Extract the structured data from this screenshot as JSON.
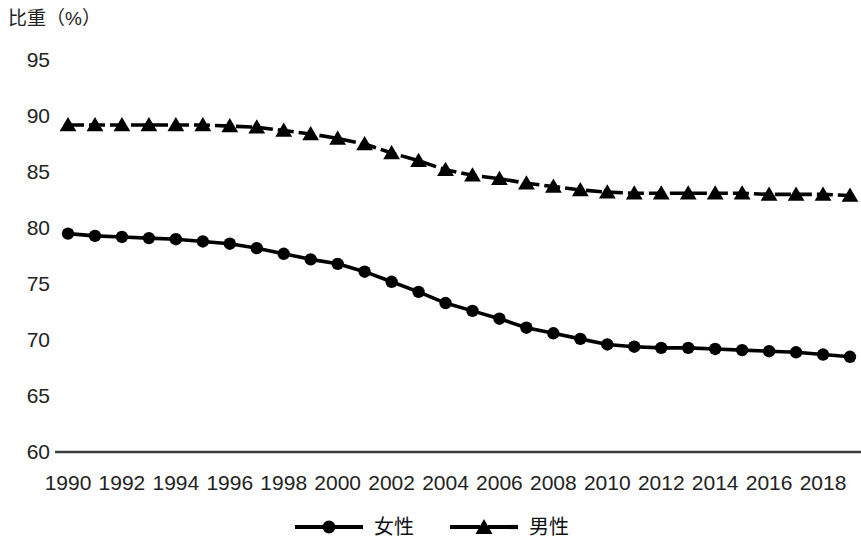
{
  "chart_data": {
    "type": "line",
    "title": "比重（%）",
    "xlabel": "",
    "ylabel": "比重（%）",
    "ylim": [
      60,
      95
    ],
    "ytick_step": 5,
    "yticks": [
      95,
      90,
      85,
      80,
      75,
      70,
      65,
      60
    ],
    "xlim": [
      1990,
      2019
    ],
    "xticks": [
      1990,
      1992,
      1994,
      1996,
      1998,
      2000,
      2002,
      2004,
      2006,
      2008,
      2010,
      2012,
      2014,
      2016,
      2018
    ],
    "x": [
      1990,
      1991,
      1992,
      1993,
      1994,
      1995,
      1996,
      1997,
      1998,
      1999,
      2000,
      2001,
      2002,
      2003,
      2004,
      2005,
      2006,
      2007,
      2008,
      2009,
      2010,
      2011,
      2012,
      2013,
      2014,
      2015,
      2016,
      2017,
      2018,
      2019
    ],
    "grid": false,
    "legend_position": "bottom",
    "series": [
      {
        "name": "女性",
        "marker": "circle",
        "linestyle": "solid",
        "color": "#000000",
        "values": [
          79.5,
          79.3,
          79.2,
          79.1,
          79.0,
          78.8,
          78.6,
          78.2,
          77.7,
          77.2,
          76.8,
          76.1,
          75.2,
          74.3,
          73.3,
          72.6,
          71.9,
          71.1,
          70.6,
          70.1,
          69.6,
          69.4,
          69.3,
          69.3,
          69.2,
          69.1,
          69.0,
          68.9,
          68.7,
          68.5
        ]
      },
      {
        "name": "男性",
        "marker": "triangle",
        "linestyle": "dashed",
        "color": "#000000",
        "values": [
          89.2,
          89.2,
          89.2,
          89.2,
          89.2,
          89.2,
          89.1,
          89.0,
          88.7,
          88.4,
          88.0,
          87.5,
          86.7,
          86.0,
          85.2,
          84.7,
          84.4,
          84.0,
          83.7,
          83.4,
          83.2,
          83.1,
          83.1,
          83.1,
          83.1,
          83.1,
          83.0,
          83.0,
          83.0,
          82.9
        ]
      }
    ]
  },
  "legend": {
    "entries": [
      {
        "label": "女性",
        "marker": "circle-marker-icon"
      },
      {
        "label": "男性",
        "marker": "triangle-marker-icon"
      }
    ]
  }
}
